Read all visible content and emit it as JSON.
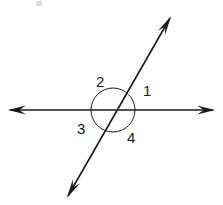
{
  "figure": {
    "background_color": "#ffffff",
    "stroke_color": "#1a1a1a",
    "label_color": "#1a1a1a",
    "width": 223,
    "height": 205
  },
  "intersection": {
    "x": 113,
    "y": 110
  },
  "lines": [
    {
      "name": "horizontal-line",
      "x1": 10,
      "y1": 110,
      "x2": 213,
      "y2": 110,
      "arrow_start": true,
      "arrow_end": true
    },
    {
      "name": "diagonal-line",
      "x1": 68,
      "y1": 196,
      "x2": 170,
      "y2": 18,
      "arrow_start": true,
      "arrow_end": true
    }
  ],
  "angle_circle": {
    "name": "angle-arc-circle",
    "cx": 113,
    "cy": 110,
    "r": 22
  },
  "labels": [
    {
      "id": "1",
      "text": "1",
      "x": 143,
      "y": 83,
      "region": "upper-right"
    },
    {
      "id": "2",
      "text": "2",
      "x": 96,
      "y": 74,
      "region": "upper-left"
    },
    {
      "id": "3",
      "text": "3",
      "x": 77,
      "y": 121,
      "region": "lower-left"
    },
    {
      "id": "4",
      "text": "4",
      "x": 127,
      "y": 130,
      "region": "lower-right"
    }
  ],
  "artifacts": [
    {
      "name": "scan-smudge",
      "x": 36,
      "y": 1,
      "width": 6,
      "height": 5
    }
  ]
}
